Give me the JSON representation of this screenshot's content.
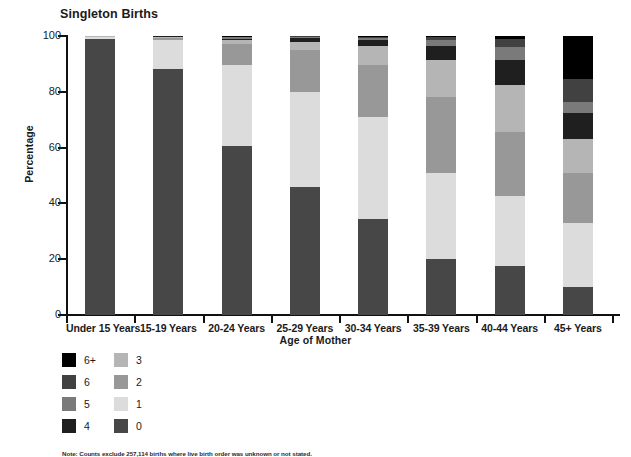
{
  "chart_data": {
    "type": "bar",
    "subtype": "stacked-bar-100",
    "title": "Singleton Births",
    "xlabel": "Age of Mother",
    "ylabel": "Percentage",
    "ylim": [
      0,
      100
    ],
    "yticks": [
      0,
      20,
      40,
      60,
      80,
      100
    ],
    "grid": false,
    "legend_position": "below-left",
    "categories": [
      "Under 15 Years",
      "15-19 Years",
      "20-24 Years",
      "25-29 Years",
      "30-34 Years",
      "35-39 Years",
      "40-44 Years",
      "45+ Years"
    ],
    "series": [
      {
        "name": "0",
        "color": "#474747",
        "values": [
          99.0,
          88.0,
          60.5,
          46.0,
          34.5,
          20.0,
          17.5,
          10.0
        ]
      },
      {
        "name": "1",
        "color": "#dcdcdc",
        "values": [
          0.6,
          10.5,
          29.0,
          34.0,
          36.5,
          31.0,
          25.0,
          23.0
        ]
      },
      {
        "name": "2",
        "color": "#989898",
        "values": [
          0.2,
          0.8,
          7.5,
          15.0,
          18.5,
          27.0,
          23.0,
          18.0
        ]
      },
      {
        "name": "3",
        "color": "#b5b5b5",
        "values": [
          0.1,
          0.4,
          1.5,
          3.0,
          7.0,
          13.5,
          17.0,
          12.0
        ]
      },
      {
        "name": "4",
        "color": "#1f1f1f",
        "values": [
          0.05,
          0.2,
          0.6,
          1.2,
          2.0,
          5.0,
          9.0,
          9.5
        ]
      },
      {
        "name": "5",
        "color": "#7a7a7a",
        "values": [
          0.03,
          0.1,
          0.4,
          0.5,
          0.9,
          2.0,
          4.5,
          4.0
        ]
      },
      {
        "name": "6",
        "color": "#414141",
        "values": [
          0.02,
          0.0,
          0.3,
          0.2,
          0.4,
          1.0,
          3.0,
          8.0
        ]
      },
      {
        "name": "6+",
        "color": "#000000",
        "values": [
          0.0,
          0.0,
          0.2,
          0.1,
          0.2,
          0.5,
          1.0,
          15.5
        ]
      }
    ]
  },
  "legend": {
    "column1": [
      {
        "label": "6+",
        "color": "#000000"
      },
      {
        "label": "6",
        "color": "#414141"
      },
      {
        "label": "5",
        "color": "#7a7a7a"
      },
      {
        "label": "4",
        "color": "#1f1f1f"
      }
    ],
    "column2": [
      {
        "label": "3",
        "color": "#b5b5b5"
      },
      {
        "label": "2",
        "color": "#989898"
      },
      {
        "label": "1",
        "color": "#dcdcdc"
      },
      {
        "label": "0",
        "color": "#474747"
      }
    ]
  },
  "footnote": {
    "text": "Note: Counts exclude 257,114 births where live birth order was unknown or not stated."
  }
}
